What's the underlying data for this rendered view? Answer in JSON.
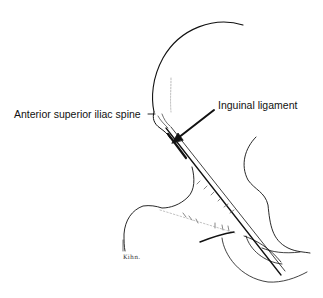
{
  "figure": {
    "type": "anatomical line drawing",
    "labels": {
      "anterior_superior_iliac_spine": "Anterior superior iliac spine",
      "inguinal_ligament": "Inguinal ligament"
    },
    "signature": "Kihn.",
    "colors": {
      "ink": "#111111",
      "background": "#ffffff"
    }
  }
}
